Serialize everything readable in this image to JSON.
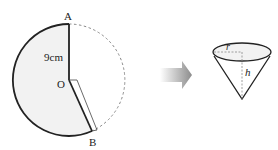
{
  "diagram": {
    "sector": {
      "point_a_label": "A",
      "center_label": "O",
      "point_b_label": "B",
      "radius_label": "9cm",
      "fill_color": "#f2f2f2",
      "stroke_color": "#222222",
      "dashed_color": "#888888"
    },
    "arrow": {
      "direction": "right",
      "color_start": "#ffffff",
      "color_end": "#8c8c8c"
    },
    "cone": {
      "radius_label": "r",
      "height_label": "h",
      "fill_color": "#ffffff",
      "stroke_color": "#222222"
    }
  }
}
